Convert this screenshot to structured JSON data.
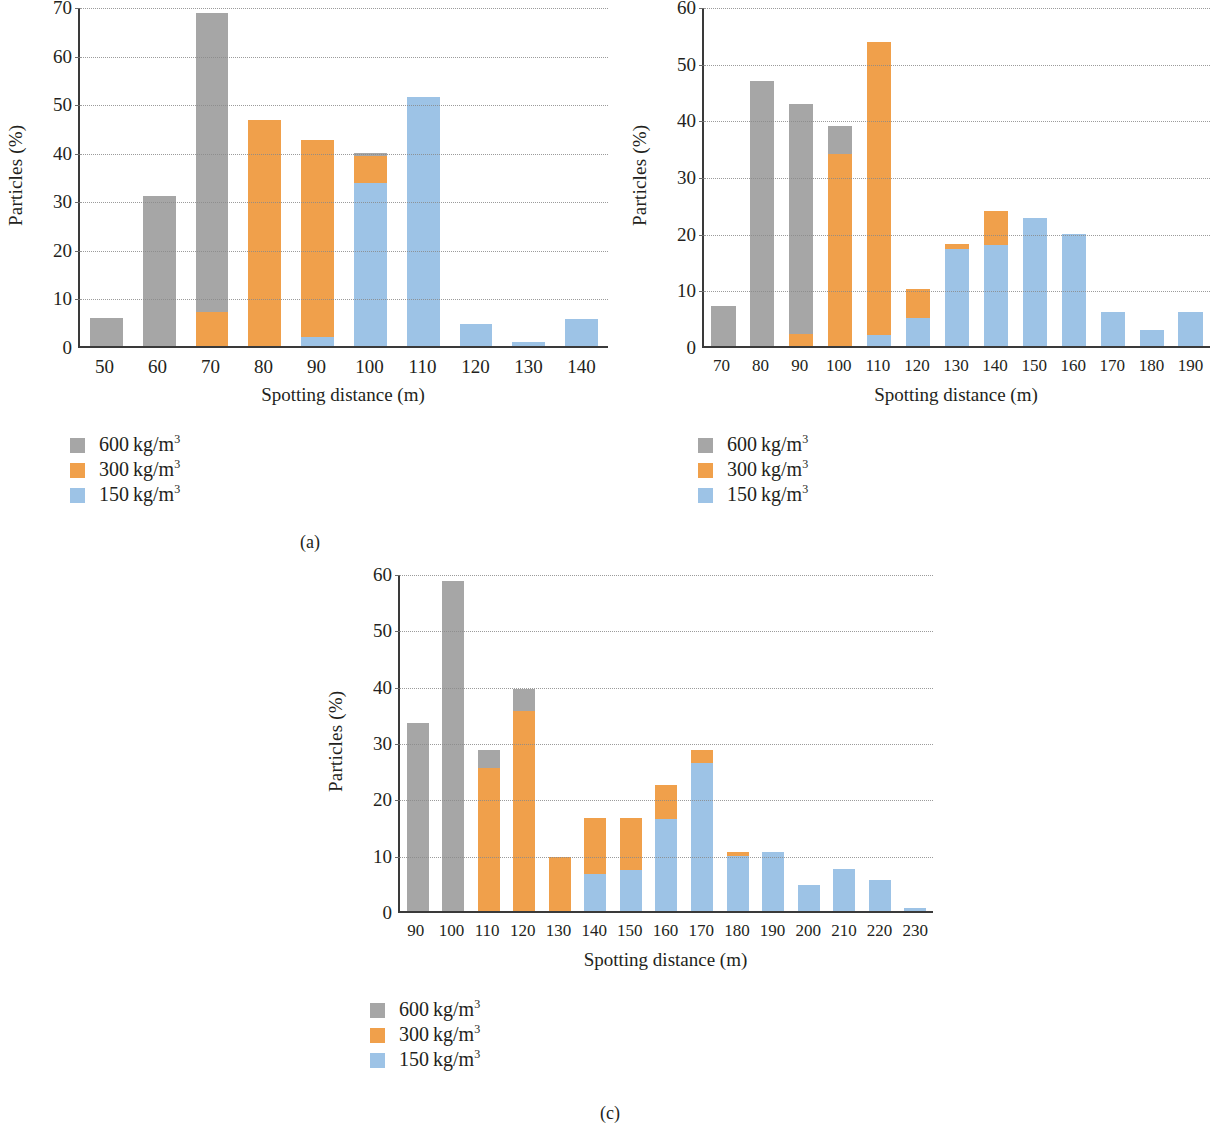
{
  "figure": {
    "background": "#ffffff",
    "colors": {
      "series_600": "#a6a6a6",
      "series_300": "#f0a04b",
      "series_150": "#9dc3e6",
      "axis": "#3a3a3a",
      "grid": "#8a8a8a",
      "text": "#231f20"
    },
    "legend_entries": [
      {
        "label_value": "600",
        "label_unit": "kg/m",
        "label_exp": "3",
        "color": "#a6a6a6"
      },
      {
        "label_value": "300",
        "label_unit": "kg/m",
        "label_exp": "3",
        "color": "#f0a04b"
      },
      {
        "label_value": "150",
        "label_unit": "kg/m",
        "label_exp": "3",
        "color": "#9dc3e6"
      }
    ],
    "captions": {
      "a": "(a)",
      "b": "(b)",
      "c": "(c)"
    }
  },
  "chart_data": [
    {
      "id": "a",
      "type": "bar",
      "stacked": true,
      "title": "",
      "xlabel": "Spotting distance (m)",
      "ylabel": "Particles (%)",
      "ylim": [
        0,
        70
      ],
      "yticks": [
        0,
        10,
        20,
        30,
        40,
        50,
        60,
        70
      ],
      "ytick_labels": [
        "0",
        "10",
        "20",
        "30",
        "40",
        "50",
        "60",
        "70"
      ],
      "grid": true,
      "legend_position": "below-left",
      "categories": [
        "50",
        "60",
        "70",
        "80",
        "90",
        "100",
        "110",
        "120",
        "130",
        "140"
      ],
      "series": [
        {
          "name": "150 kg/m3",
          "color": "#9dc3e6",
          "values": [
            0,
            0,
            0,
            0,
            1.8,
            33.8,
            51.6,
            4.6,
            0.8,
            5.6
          ]
        },
        {
          "name": "300 kg/m3",
          "color": "#f0a04b",
          "values": [
            0,
            0,
            7.0,
            46.8,
            40.9,
            5.5,
            0,
            0,
            0,
            0
          ]
        },
        {
          "name": "600 kg/m3",
          "color": "#a6a6a6",
          "values": [
            5.9,
            31.0,
            62.0,
            0,
            0,
            0.6,
            0,
            0,
            0,
            0
          ]
        }
      ],
      "totals": [
        5.9,
        31.0,
        69.0,
        46.8,
        42.7,
        39.9,
        51.6,
        4.6,
        0.8,
        5.6
      ]
    },
    {
      "id": "b",
      "type": "bar",
      "stacked": true,
      "title": "",
      "xlabel": "Spotting distance (m)",
      "ylabel": "Particles (%)",
      "ylim": [
        0,
        60
      ],
      "yticks": [
        0,
        10,
        20,
        30,
        40,
        50,
        60
      ],
      "ytick_labels": [
        "0",
        "10",
        "20",
        "30",
        "40",
        "50",
        "60"
      ],
      "grid": true,
      "legend_position": "below-left",
      "categories": [
        "70",
        "80",
        "90",
        "100",
        "110",
        "120",
        "130",
        "140",
        "150",
        "160",
        "170",
        "180",
        "190"
      ],
      "series": [
        {
          "name": "150 kg/m3",
          "color": "#9dc3e6",
          "values": [
            0,
            0,
            0,
            0,
            2.0,
            5.0,
            17.3,
            17.9,
            22.7,
            19.9,
            6.0,
            2.9,
            6.0
          ]
        },
        {
          "name": "300 kg/m3",
          "color": "#f0a04b",
          "values": [
            0,
            0,
            2.1,
            34.0,
            51.9,
            5.1,
            0.8,
            6.1,
            0,
            0,
            0,
            0,
            0
          ]
        },
        {
          "name": "600 kg/m3",
          "color": "#a6a6a6",
          "values": [
            7.1,
            47.0,
            40.8,
            5.0,
            0,
            0,
            0,
            0,
            0,
            0,
            0,
            0,
            0
          ]
        }
      ],
      "totals": [
        7.1,
        47.0,
        42.9,
        39.0,
        53.9,
        10.1,
        18.1,
        24.0,
        22.7,
        19.9,
        6.0,
        2.9,
        6.0
      ]
    },
    {
      "id": "c",
      "type": "bar",
      "stacked": true,
      "title": "",
      "xlabel": "Spotting distance (m)",
      "ylabel": "Particles (%)",
      "ylim": [
        0,
        60
      ],
      "yticks": [
        0,
        10,
        20,
        30,
        40,
        50,
        60
      ],
      "ytick_labels": [
        "0",
        "10",
        "20",
        "30",
        "40",
        "50",
        "60"
      ],
      "grid": true,
      "legend_position": "below-center",
      "categories": [
        "90",
        "100",
        "110",
        "120",
        "130",
        "140",
        "150",
        "160",
        "170",
        "180",
        "190",
        "200",
        "210",
        "220",
        "230"
      ],
      "series": [
        {
          "name": "150 kg/m3",
          "color": "#9dc3e6",
          "values": [
            0,
            0,
            0,
            0,
            0,
            6.6,
            7.4,
            16.4,
            26.5,
            9.8,
            10.5,
            4.6,
            7.5,
            5.5,
            0.6
          ]
        },
        {
          "name": "300 kg/m3",
          "color": "#f0a04b",
          "values": [
            0,
            0,
            25.5,
            35.7,
            9.7,
            10.0,
            9.2,
            6.1,
            2.2,
            0.8,
            0,
            0,
            0,
            0,
            0
          ]
        },
        {
          "name": "600 kg/m3",
          "color": "#a6a6a6",
          "values": [
            33.6,
            58.9,
            3.2,
            4.0,
            0,
            0,
            0,
            0,
            0,
            0,
            0,
            0,
            0,
            0,
            0
          ]
        }
      ],
      "totals": [
        33.6,
        58.9,
        28.7,
        39.7,
        9.7,
        16.6,
        16.6,
        22.5,
        28.7,
        10.6,
        10.5,
        4.6,
        7.5,
        5.5,
        0.6
      ]
    }
  ]
}
